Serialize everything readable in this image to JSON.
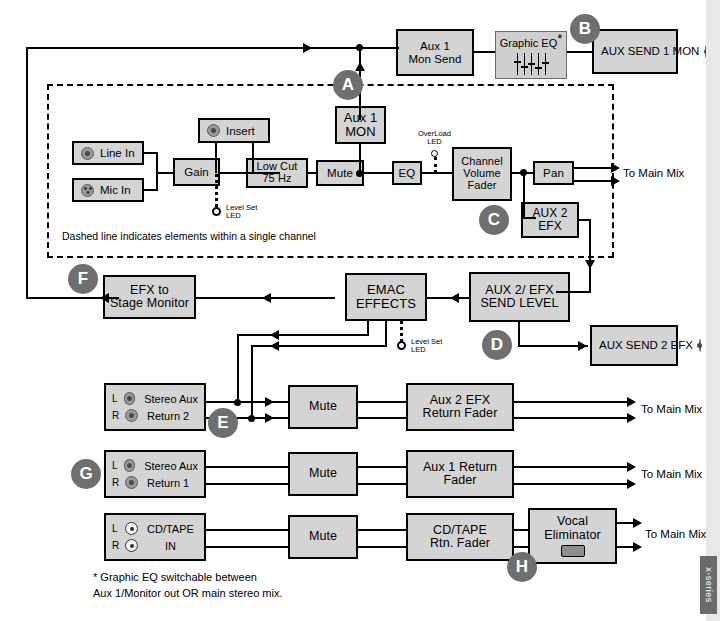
{
  "diagram": {
    "side_tab_label": "x-series",
    "dashed_note": "Dashed line indicates elements within a single channel",
    "footnote": "* Graphic EQ switchable between\n   Aux 1/Monitor out OR main stereo mix.",
    "colors": {
      "block_fill": "#d4d4d4",
      "block_stroke": "#000000",
      "badge_fill": "#6f6f6f",
      "badge_text": "#ffffff",
      "eq_fill": "#cfcfcf",
      "side_tab": "#6a6a6a"
    }
  },
  "badges": [
    {
      "id": "A",
      "label": "A"
    },
    {
      "id": "B",
      "label": "B"
    },
    {
      "id": "C",
      "label": "C"
    },
    {
      "id": "D",
      "label": "D"
    },
    {
      "id": "E",
      "label": "E"
    },
    {
      "id": "F",
      "label": "F"
    },
    {
      "id": "G",
      "label": "G"
    },
    {
      "id": "H",
      "label": "H"
    }
  ],
  "blocks": {
    "aux1_mon_send": "Aux 1\nMon Send",
    "graphic_eq": "Graphic EQ",
    "graphic_eq_star": "*",
    "aux_send_1_mon": "AUX SEND\n1 MON",
    "aux1_mon": "Aux 1\nMON",
    "insert": "Insert",
    "line_in": "Line In",
    "mic_in": "Mic In",
    "gain": "Gain",
    "low_cut": "Low Cut\n75 Hz",
    "mute_channel": "Mute",
    "eq": "EQ",
    "channel_volume_fader": "Channel\nVolume\nFader",
    "pan": "Pan",
    "aux2_efx": "AUX 2\nEFX",
    "efx_to_stage_monitor": "EFX to\nStage Monitor",
    "emac_effects": "EMAC\nEFFECTS",
    "aux2_efx_send_level": "AUX 2/ EFX\nSEND LEVEL",
    "aux_send_2_efx": "AUX SEND\n2 EFX",
    "stereo_aux_return_2": "Stereo Aux\nReturn 2",
    "stereo_aux_return_1": "Stereo Aux\nReturn 1",
    "cd_tape_in": "CD/TAPE\nIN",
    "mute_return_2": "Mute",
    "mute_return_1": "Mute",
    "mute_cd_tape": "Mute",
    "aux2_efx_return_fader": "Aux 2 EFX\nReturn Fader",
    "aux1_return_fader": "Aux 1 Return\nFader",
    "cd_tape_rtn_fader": "CD/TAPE\nRtn. Fader",
    "vocal_eliminator": "Vocal\nEliminator"
  },
  "labels": {
    "level_set_led_1": "Level Set\nLED",
    "level_set_led_2": "Level Set\nLED",
    "overload_led": "OverLoad\nLED",
    "to_main_mix_channel": "To Main Mix",
    "to_main_mix_return2": "To Main Mix",
    "to_main_mix_return1": "To Main Mix",
    "to_main_mix_cdtape": "To Main Mix",
    "lr": {
      "left": "L",
      "right": "R"
    }
  },
  "icons": {
    "line_in_jack": "trs-jack-icon",
    "mic_in_jack": "xlr-jack-icon",
    "insert_jack": "trs-jack-icon",
    "aux_send_1_jack": "trs-jack-icon",
    "aux_send_2_jack": "trs-jack-icon",
    "return_jack": "trs-jack-icon",
    "cd_tape_jack": "rca-jack-icon",
    "vocal_eliminator_switch": "switch-button-icon"
  }
}
